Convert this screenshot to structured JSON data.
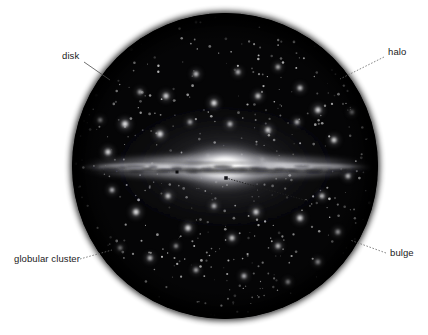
{
  "figure": {
    "background_color": "#ffffff",
    "width": 428,
    "height": 335
  },
  "telescope_view": {
    "name": "circular-field-of-view",
    "center_x": 225,
    "center_y": 166,
    "radius": 153,
    "sky_color": "#050506",
    "edge_color": "#000000"
  },
  "galaxy": {
    "name": "edge-on-spiral-galaxy",
    "core_color": "#ffffff",
    "disk_color": "#d8d8d8",
    "halo_glow_color": "#3a3a3e",
    "dust_lane_color": "#1d1d20",
    "core_center_x": 225,
    "core_center_y": 167,
    "disk_half_length": 148,
    "disk_half_height": 5,
    "bulge_radius_x": 46,
    "bulge_radius_y": 20
  },
  "labels": [
    {
      "id": "disk",
      "text": "disk",
      "text_x": 62,
      "text_y": 59,
      "anchor": "start",
      "leader_from_x": 84,
      "leader_from_y": 62,
      "leader_to_x": 110,
      "leader_to_y": 80,
      "style": "solid",
      "points_to": "galactic disk plane edge"
    },
    {
      "id": "halo",
      "text": "halo",
      "text_x": 388,
      "text_y": 55,
      "anchor": "start",
      "leader_from_x": 384,
      "leader_from_y": 57,
      "leader_to_x": 340,
      "leader_to_y": 79,
      "style": "dashed",
      "points_to": "spherical halo of globular clusters"
    },
    {
      "id": "globular-cluster",
      "text": "globular cluster",
      "text_x": 14,
      "text_y": 262,
      "anchor": "start",
      "leader_from_x": 80,
      "leader_from_y": 259,
      "leader_to_x": 112,
      "leader_to_y": 250,
      "style": "dashed",
      "points_to": "fuzzy star cluster in halo"
    },
    {
      "id": "bulge",
      "text": "bulge",
      "text_x": 390,
      "text_y": 256,
      "anchor": "start",
      "leader_from_x": 386,
      "leader_from_y": 253,
      "leader_to_x": 350,
      "leader_to_y": 240,
      "style": "dashed",
      "points_to": "central bulge"
    }
  ],
  "inner_pointer": {
    "name": "bulge-core-pointer",
    "from_x": 308,
    "from_y": 201,
    "to_x": 226,
    "to_y": 178,
    "marker_x": 226,
    "marker_y": 178,
    "marker_size": 3.5,
    "style": "dashed"
  },
  "dust_knot": {
    "name": "dust-knot-marker",
    "x": 177,
    "y": 172,
    "size": 3
  },
  "globular_clusters": [
    {
      "x": 125,
      "y": 124,
      "r": 4.6,
      "b": 0.95
    },
    {
      "x": 166,
      "y": 96,
      "r": 4.0,
      "b": 0.9
    },
    {
      "x": 196,
      "y": 74,
      "r": 3.6,
      "b": 0.85
    },
    {
      "x": 214,
      "y": 103,
      "r": 4.2,
      "b": 0.95
    },
    {
      "x": 238,
      "y": 72,
      "r": 3.4,
      "b": 0.8
    },
    {
      "x": 258,
      "y": 96,
      "r": 3.8,
      "b": 0.85
    },
    {
      "x": 278,
      "y": 67,
      "r": 3.2,
      "b": 0.8
    },
    {
      "x": 300,
      "y": 88,
      "r": 3.6,
      "b": 0.85
    },
    {
      "x": 318,
      "y": 110,
      "r": 4.2,
      "b": 0.9
    },
    {
      "x": 140,
      "y": 92,
      "r": 3.2,
      "b": 0.78
    },
    {
      "x": 160,
      "y": 134,
      "r": 4.4,
      "b": 0.95
    },
    {
      "x": 190,
      "y": 122,
      "r": 3.2,
      "b": 0.78
    },
    {
      "x": 230,
      "y": 124,
      "r": 3.6,
      "b": 0.8
    },
    {
      "x": 268,
      "y": 130,
      "r": 4.0,
      "b": 0.88
    },
    {
      "x": 297,
      "y": 122,
      "r": 3.4,
      "b": 0.8
    },
    {
      "x": 334,
      "y": 140,
      "r": 4.0,
      "b": 0.88
    },
    {
      "x": 108,
      "y": 152,
      "r": 4.2,
      "b": 0.9
    },
    {
      "x": 112,
      "y": 190,
      "r": 3.4,
      "b": 0.8
    },
    {
      "x": 136,
      "y": 212,
      "r": 4.4,
      "b": 0.95
    },
    {
      "x": 168,
      "y": 196,
      "r": 3.8,
      "b": 0.85
    },
    {
      "x": 188,
      "y": 228,
      "r": 4.2,
      "b": 0.92
    },
    {
      "x": 214,
      "y": 206,
      "r": 3.4,
      "b": 0.8
    },
    {
      "x": 232,
      "y": 238,
      "r": 3.8,
      "b": 0.85
    },
    {
      "x": 256,
      "y": 212,
      "r": 4.0,
      "b": 0.88
    },
    {
      "x": 278,
      "y": 246,
      "r": 3.6,
      "b": 0.82
    },
    {
      "x": 300,
      "y": 218,
      "r": 4.2,
      "b": 0.9
    },
    {
      "x": 322,
      "y": 196,
      "r": 3.6,
      "b": 0.82
    },
    {
      "x": 338,
      "y": 232,
      "r": 3.4,
      "b": 0.8
    },
    {
      "x": 150,
      "y": 258,
      "r": 3.6,
      "b": 0.82
    },
    {
      "x": 196,
      "y": 270,
      "r": 3.2,
      "b": 0.78
    },
    {
      "x": 244,
      "y": 276,
      "r": 3.4,
      "b": 0.8
    },
    {
      "x": 288,
      "y": 282,
      "r": 3.0,
      "b": 0.75
    },
    {
      "x": 318,
      "y": 262,
      "r": 3.4,
      "b": 0.8
    },
    {
      "x": 120,
      "y": 248,
      "r": 3.0,
      "b": 0.75
    },
    {
      "x": 348,
      "y": 176,
      "r": 3.6,
      "b": 0.82
    },
    {
      "x": 100,
      "y": 120,
      "r": 3.0,
      "b": 0.72
    },
    {
      "x": 352,
      "y": 112,
      "r": 3.0,
      "b": 0.72
    },
    {
      "x": 262,
      "y": 160,
      "r": 2.6,
      "b": 0.7
    },
    {
      "x": 176,
      "y": 246,
      "r": 2.8,
      "b": 0.72
    },
    {
      "x": 208,
      "y": 156,
      "r": 2.4,
      "b": 0.65
    }
  ],
  "star_field": {
    "name": "background-stars",
    "count": 420,
    "color": "#e8e8e8",
    "seed": 20240517
  }
}
